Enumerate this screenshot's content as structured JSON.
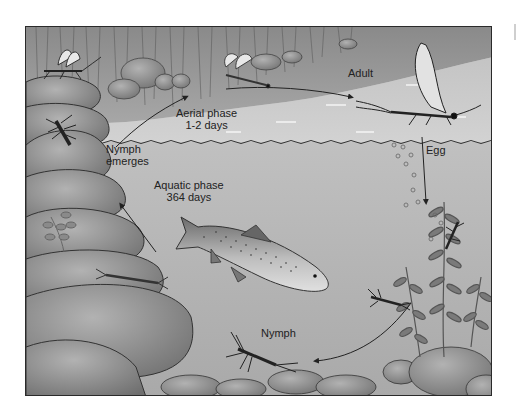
{
  "diagram": {
    "labels": {
      "adult": "Adult",
      "aerial_phase": {
        "line1": "Aerial phase",
        "line2": "1-2 days"
      },
      "egg": "Egg",
      "nymph_emerges": {
        "line1": "Nymph",
        "line2": "emerges"
      },
      "aquatic_phase": {
        "line1": "Aquatic phase",
        "line2": "364 days"
      },
      "nymph": "Nymph"
    },
    "elements": [
      "reeds",
      "rocks",
      "water-surface",
      "adult-mayfly",
      "subimago-mayflies",
      "egg-bubbles",
      "trout",
      "nymphs",
      "aquatic-plants",
      "cycle-arrows"
    ],
    "colors": {
      "sky_reeds": "#9a9a9a",
      "water_surface": "#c8c8c8",
      "underwater": "#b4b4b4",
      "rocks": "#8e8e8e",
      "outline": "#2a2a2a",
      "text": "#222222"
    }
  }
}
